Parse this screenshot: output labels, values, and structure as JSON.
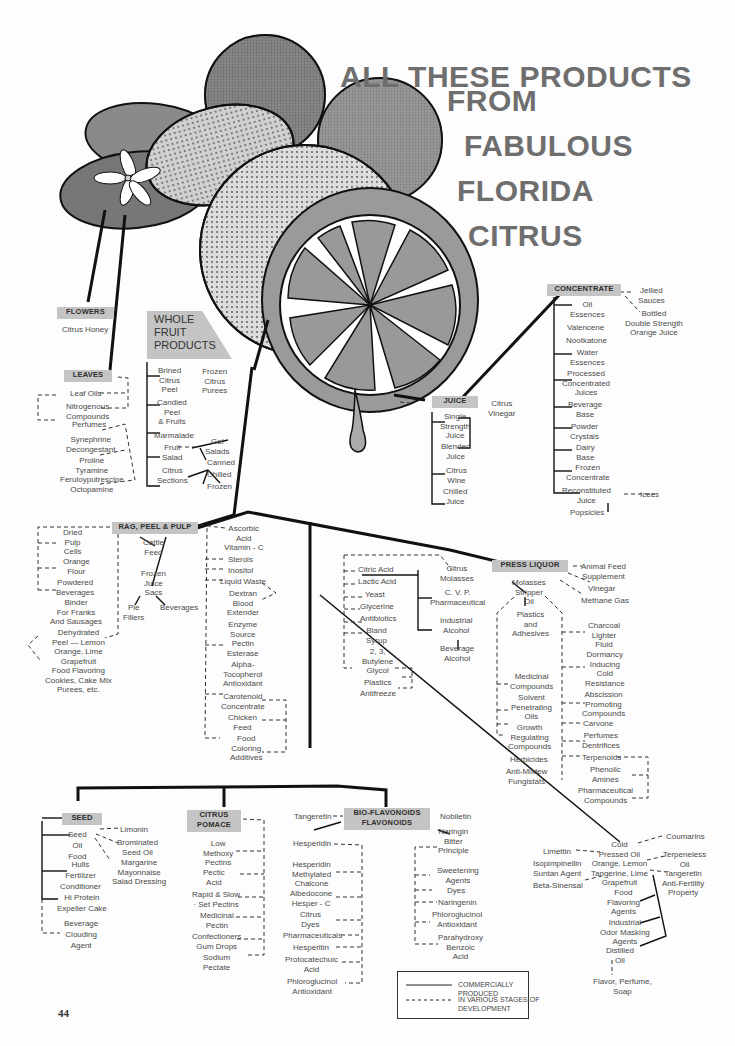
{
  "title": {
    "line1": "ALL THESE PRODUCTS",
    "line2": "FROM",
    "line3": "FABULOUS",
    "line4": "FLORIDA",
    "line5": "CITRUS"
  },
  "page_number": "44",
  "illustration": {
    "subject": "citrus fruits, leaves, blossom and halved orange with juice drop"
  },
  "flowers": {
    "label": "FLOWERS",
    "items": [
      "Citrus Honey"
    ]
  },
  "leaves": {
    "label": "LEAVES",
    "items": [
      "Leaf Oils",
      "Nitrogenous\nCompounds",
      "Perfumes",
      "Synephrine\nDecongestant",
      "Proline\nTyramine\nFeruloyputrescine\nOctopamine"
    ]
  },
  "whole_fruit": {
    "label": "WHOLE\nFRUIT\nPRODUCTS",
    "items": [
      "Brined\nCitrus\nPeel",
      "Candied\nPeel\n& Fruits",
      "Marmalade",
      "Fruit\nSalad",
      "Citrus\nSections",
      "Frozen\nCitrus\nPurees",
      "Gel\nSalads",
      "Canned",
      "Chilled",
      "Frozen"
    ]
  },
  "juice": {
    "label": "JUICE",
    "items": [
      "Citrus\nVinegar",
      "Single\nStrength\nJuice",
      "Blended\nJuice",
      "Citrus\nWine",
      "Chilled\nJuice"
    ]
  },
  "concentrate": {
    "label": "CONCENTRATE",
    "items": [
      "Oil\nEssences",
      "Valencene",
      "Nootkatone",
      "Water\nEssences",
      "Processed\nConcentrated\nJuices",
      "Beverage\nBase",
      "Powder\nCrystals",
      "Dairy\nBase",
      "Frozen\nConcentrate",
      "Reconstituted\nJuice",
      "Popsicles",
      "Icees",
      "Jellied\nSauces",
      "Bottled\nDouble Strength\nOrange Juice"
    ]
  },
  "rag_peel_pulp": {
    "label": "RAG, PEEL & PULP",
    "left": [
      "Dried\nPulp\nCells",
      "Orange\nFlour",
      "Powdered\nBeverages",
      "Binder\nFor Franks\nAnd Sausages",
      "Dehydrated\nPeel — Lemon\nOrange, Lime\nGrapefruit",
      "Food Flavoring\nCookies, Cake Mix\nPurees, etc."
    ],
    "middle": [
      "Cattle\nFeed",
      "Frozen\nJuice\nSacs",
      "Pie\nFillers",
      "Beverages"
    ],
    "right": [
      "Ascorbic\nAcid\nVitamin - C",
      "Sterols",
      "Inositol",
      "Liquid Waste",
      "Dextran\nBlood\nExtender",
      "Enzyme\nSource\nPectin\nEsterase",
      "Alpha-\nTocopherol\nAntioxidant",
      "Carotenoid\nConcentrate",
      "Chicken\nFeed",
      "Food\nColoring\nAdditives"
    ]
  },
  "press_liquor": {
    "label": "PRESS LIQUOR",
    "left": [
      "Citric Acid",
      "Lactic Acid",
      "Yeast",
      "Glycerine",
      "Antibiotics",
      "Bland\nSyrup",
      "2, 3,\nButylene\nGlycol",
      "Plastics",
      "Antifreeze"
    ],
    "middle": [
      "Citrus\nMolasses",
      "C. V. P.\nPharmaceutical",
      "Industrial\nAlcohol",
      "Beverage\nAlcohol"
    ],
    "stripper": [
      "Molasses\nStripper\nOil",
      "Plastics\nand\nAdhesives",
      "Medicinal\nCompounds",
      "Solvent\nPenetrating\nOils",
      "Growth\nRegulating\nCompounds",
      "Herbicides",
      "Anti-Mildew\nFungistats"
    ],
    "right": [
      "Animal Feed\nSupplement",
      "Vinegar",
      "Methane Gas",
      "Charcoal\nLighter\nFluid",
      "Dormancy\nInducing\nCold\nResistance",
      "Abscission\nPromoting\nCompounds",
      "Carvone",
      "Perfumes\nDentrifices",
      "Terpenoids",
      "Phenolic\nAmines",
      "Pharmaceutical\nCompounds"
    ]
  },
  "seed": {
    "label": "SEED",
    "items": [
      "Seed\nOil\nFood",
      "Hulls\nFertilizer\nConditioner",
      "Hi Protein\nExpeller Cake",
      "Beverage\nClouding\nAgent",
      "Limonin",
      "Brominated\nSeed Oil",
      "Margarine\nMayonnaise\nSalad Dressing"
    ]
  },
  "citrus_pomace": {
    "label": "CITRUS\nPOMACE",
    "items": [
      "Low\nMethoxy\nPectins",
      "Pectic\nAcid",
      "Rapid & Slow\n· Set Pectins",
      "Medicinal\nPectin",
      "Confectioners\nGum Drops",
      "Sodium\nPectate"
    ]
  },
  "bioflavonoids": {
    "label": "BIO-FLAVONOIDS\nFLAVONOIDS",
    "left": [
      "Tangeretin",
      "Hesperidin",
      "Hesperidin\nMethylated\nChalcone",
      "Albedocone\nHesper - C",
      "Citrus\nDyes",
      "Pharmaceuticals",
      "Hesperitin",
      "Protocatechuic\nAcid",
      "Phloroglucinol\nAntioxidant"
    ],
    "right": [
      "Nobiletin",
      "Naringin\nBitter\nPrinciple",
      "Sweetening\nAgents",
      "Dyes",
      "Naringenin",
      "Phloroglucinol\nAntioxidant",
      "Parahydroxy\nBenzoic\nAcid"
    ]
  },
  "cold_pressed_oil": {
    "label": "Cold\nPressed Oil\nOrange, Lemon\nTangerine, Lime\nGrapefruit",
    "left": [
      "Limettin",
      "Isopimpinellin\nSuntan Agent",
      "Beta-Sinensal"
    ],
    "right": [
      "Coumarins",
      "Terpeneless\nOil",
      "Tangeretin\nAnti-Fertility\nProperty"
    ],
    "below": [
      "Food\nFlavoring\nAgents",
      "Industrial\nOdor Masking\nAgents",
      "Distilled\nOil",
      "Flavor, Perfume,\nSoap"
    ]
  },
  "legend": {
    "solid": "COMMERCIALLY PRODUCED",
    "dashed": "IN VARIOUS STAGES OF\nDEVELOPMENT"
  },
  "colors": {
    "box_fill": "#c4c4c4",
    "title": "#6e6e6e",
    "line": "#111111",
    "text": "#4a4a4a"
  }
}
